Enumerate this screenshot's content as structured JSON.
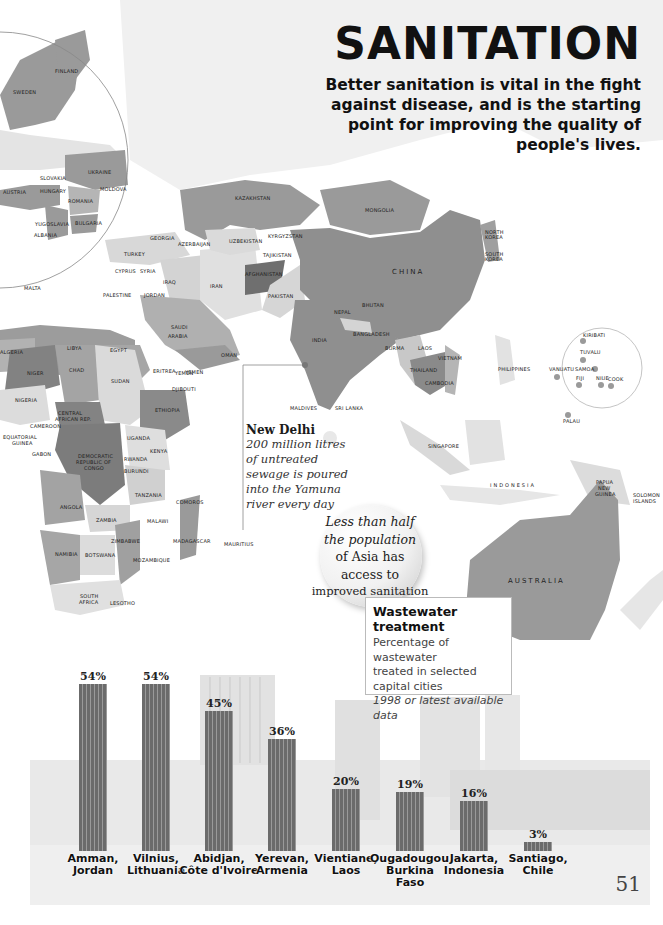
{
  "header": {
    "title": "SANITATION",
    "subtitle": "Better sanitation is vital in the fight against disease, and is the starting point for improving the quality of people's lives."
  },
  "map": {
    "region_labels": {
      "europe": [
        "FINLAND",
        "SWEDEN",
        "UKRAINE",
        "SLOVAKIA",
        "AUSTRIA",
        "HUNGARY",
        "MOLDOVA",
        "ROMANIA",
        "YUGOSLAVIA",
        "BULGARIA",
        "ALBANIA",
        "MALTA"
      ],
      "middle_east": [
        "GEORGIA",
        "AZERBAIJAN",
        "TURKEY",
        "CYPRUS",
        "LEBANON",
        "SYRIA",
        "IRAQ",
        "IRAN",
        "PALESTINE AUTHORITY",
        "JORDAN",
        "SAUDI ARABIA",
        "YEMEN",
        "OMAN"
      ],
      "asia": [
        "KAZAKHSTAN",
        "MONGOLIA",
        "UZBEKISTAN",
        "KYRGYZSTAN",
        "TAJIKISTAN",
        "AFGHANISTAN",
        "PAKISTAN",
        "CHINA",
        "NORTH KOREA",
        "SOUTH KOREA",
        "NEPAL",
        "BHUTAN",
        "INDIA",
        "BANGLADESH",
        "BURMA",
        "LAOS",
        "VIETNAM",
        "THAILAND",
        "CAMBODIA",
        "PHILIPPINES",
        "MALDIVES",
        "SRI LANKA",
        "SINGAPORE",
        "INDONESIA",
        "PAPUA NEW GUINEA",
        "SOLOMON ISLANDS",
        "AUSTRALIA"
      ],
      "pacific": [
        "KIRIBATI",
        "TUVALU",
        "VANUATU",
        "SAMOA",
        "FIJI",
        "NIUE",
        "COOK",
        "PALAU"
      ],
      "africa": [
        "LIBYA",
        "ALGERIA",
        "EGYPT",
        "NIGER",
        "CHAD",
        "SUDAN",
        "ERITREA",
        "DJIBOUTI",
        "ETHIOPIA",
        "NIGERIA",
        "CAMEROON",
        "CENTRAL AFRICAN REP.",
        "EQUATORIAL GUINEA",
        "GABON",
        "DEMOCRATIC REPUBLIC OF CONGO",
        "UGANDA",
        "KENYA",
        "RWANDA",
        "BURUNDI",
        "TANZANIA",
        "COMOROS",
        "ANGOLA",
        "ZAMBIA",
        "MALAWI",
        "ZIMBABWE",
        "MADAGASCAR",
        "MAURITIUS",
        "NAMIBIA",
        "BOTSWANA",
        "MOZAMBIQUE",
        "SOUTH AFRICA",
        "LESOTHO"
      ]
    },
    "colors": {
      "dark": "#8a8a8a",
      "mid": "#a8a8a8",
      "light": "#cfcfcf",
      "pale": "#e6e6e6"
    }
  },
  "callout": {
    "heading": "New Delhi",
    "body": "200 million litres of untreated sewage is poured into the Yamuna river every day"
  },
  "bubble": {
    "lines": [
      "Less than half",
      "the population",
      "of Asia has",
      "access to",
      "improved sanitation"
    ]
  },
  "legend": {
    "heading": "Wastewater treatment",
    "line1": "Percentage of wastewater",
    "line2": "treated in selected",
    "line3": "capital cities",
    "note": "1998 or latest available data"
  },
  "page_number": "51",
  "chart_data": {
    "type": "bar",
    "title": "Wastewater treatment",
    "subtitle": "Percentage of wastewater treated in selected capital cities, 1998 or latest available data",
    "categories": [
      "Amman, Jordan",
      "Vilnius, Lithuania",
      "Abidjan, Côte d'Ivoire",
      "Yerevan, Armenia",
      "Vientiane, Laos",
      "Ougadougou, Burkina Faso",
      "Jakarta, Indonesia",
      "Santiago, Chile"
    ],
    "category_lines": [
      [
        "Amman,",
        "Jordan"
      ],
      [
        "Vilnius,",
        "Lithuania"
      ],
      [
        "Abidjan,",
        "Côte d'Ivoire"
      ],
      [
        "Yerevan,",
        "Armenia"
      ],
      [
        "Vientiane,",
        "Laos"
      ],
      [
        "Ougadougou,",
        "Burkina Faso"
      ],
      [
        "Jakarta,",
        "Indonesia"
      ],
      [
        "Santiago,",
        "Chile"
      ]
    ],
    "values": [
      54,
      54,
      45,
      36,
      20,
      19,
      16,
      3
    ],
    "value_labels": [
      "54%",
      "54%",
      "45%",
      "36%",
      "20%",
      "19%",
      "16%",
      "3%"
    ],
    "unit": "%",
    "xlabel": "",
    "ylabel": "",
    "ylim": [
      0,
      60
    ],
    "grid": false,
    "legend": "none",
    "bar_color": "#6e6e6e"
  }
}
